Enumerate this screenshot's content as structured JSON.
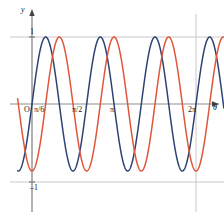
{
  "figure": {
    "kind": "math-plot",
    "background": "#ffffff"
  },
  "axes": {
    "x_axis_label": "θ",
    "y_axis_label": "y",
    "origin_label": "O",
    "x_tick_labels": [
      "π/6",
      "π/2",
      "π",
      "2π"
    ],
    "y_tick_labels": [
      "1",
      "–1"
    ],
    "axis_color": "#8f8f8f",
    "gridline_color": "#c9c9c9"
  },
  "chart_data": {
    "type": "line",
    "title": "",
    "xlabel": "θ",
    "ylabel": "y",
    "xlim": [
      -0.55,
      7.35
    ],
    "ylim": [
      -1.45,
      1.45
    ],
    "grid": true,
    "legend": "none",
    "xticks": [
      0,
      0.5235987755982988,
      1.5707963267948966,
      3.141592653589793,
      6.283185307179586
    ],
    "xticklabels": [
      "O",
      "π/6",
      "π/2",
      "π",
      "2π"
    ],
    "yticks": [
      -1,
      1
    ],
    "yticklabels": [
      "–1",
      "1"
    ],
    "hlines": [
      1,
      -1
    ],
    "vlines": [
      0,
      6.283185307179586
    ],
    "series": [
      {
        "name": "y = sin(3θ)",
        "color": "#2e4372",
        "amplitude": 1,
        "frequency": 3,
        "phase": 0,
        "equation": "sin(3*x)"
      },
      {
        "name": "y = sin(3θ – π/2)",
        "color": "#e0563a",
        "amplitude": 1,
        "frequency": 3,
        "phase": -1.5707963267948966,
        "equation": "sin(3*x - pi/2)"
      }
    ]
  }
}
